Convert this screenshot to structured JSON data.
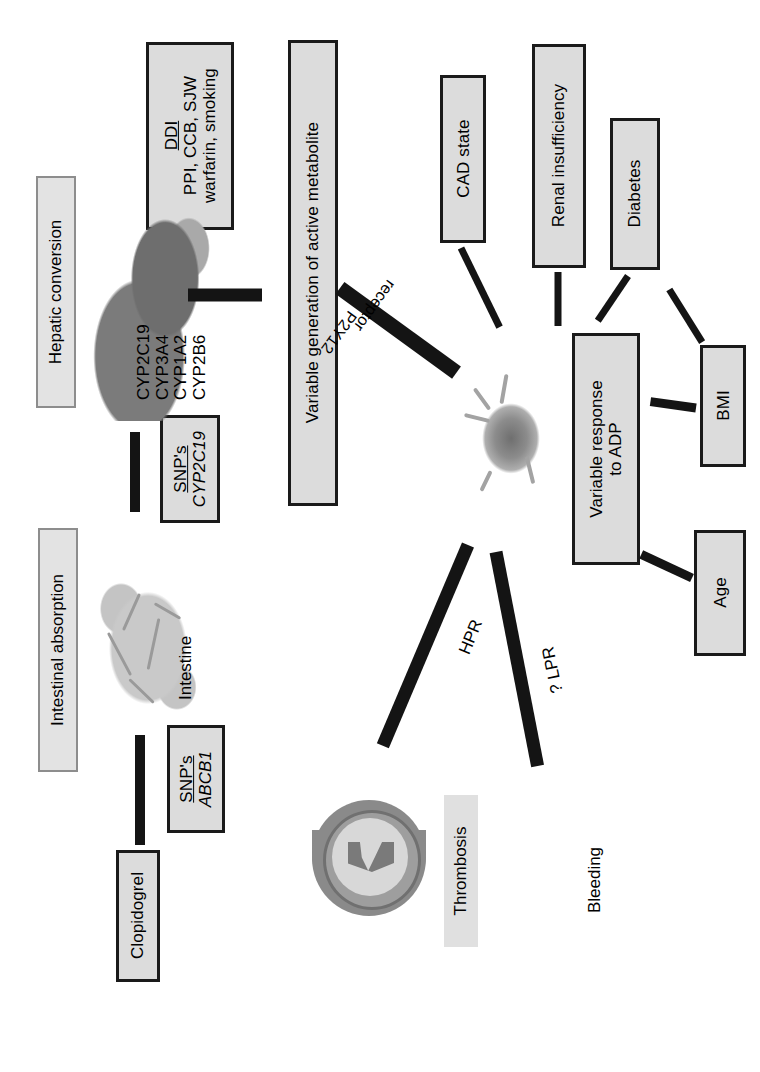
{
  "figure": {
    "orientation": "rotated-90-clockwise"
  },
  "phases": [
    {
      "id": "intestinal-absorption",
      "label": "Intestinal absorption"
    },
    {
      "id": "hepatic-conversion",
      "label": "Hepatic conversion"
    }
  ],
  "nodes": {
    "clopidogrel": "Clopidogrel",
    "snp_abcb1": {
      "heading": "SNP's",
      "gene": "ABCB1"
    },
    "snp_cyp2c19": {
      "heading": "SNP's",
      "gene": "CYP2C19"
    },
    "ddi": {
      "heading": "DDI",
      "line1": "PPI, CCB, SJW",
      "line2": "warfarin, smoking"
    },
    "variable_generation": {
      "line1": "Variable generation of active metabolite"
    },
    "cad_state": "CAD state",
    "renal_insufficiency": "Renal insufficiency",
    "diabetes": "Diabetes",
    "bmi": "BMI",
    "age": "Age",
    "variable_response": {
      "line1": "Variable response",
      "line2": "to ADP"
    },
    "thrombosis": "Thrombosis",
    "bleeding": "Bleeding"
  },
  "image_labels": {
    "intestine": "Intestine",
    "liver_enzymes": [
      "CYP2C19",
      "CYP3A4",
      "CYP1A2",
      "CYP2B6"
    ]
  },
  "edge_labels": {
    "p2y12": "P2Y12",
    "receptor": "receptor",
    "hpr": "HPR",
    "lpr": "? LPR"
  },
  "colors": {
    "node_fill": "#dcdcdc",
    "node_border": "#1a1a1a",
    "phase_fill": "#e3e3e3",
    "phase_border": "#8d8d8d",
    "arrow": "#141414",
    "background": "#ffffff"
  }
}
